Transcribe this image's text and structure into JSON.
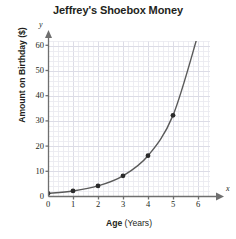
{
  "chart_data": {
    "type": "line",
    "title": "Jeffrey's Shoebox Money",
    "xlabel": "Age (Years)",
    "xlabel_bold_part": "Age",
    "xlabel_unit_part": " (Years)",
    "ylabel": "Amount on Birthday ($)",
    "x": [
      0,
      1,
      2,
      3,
      4,
      5,
      6
    ],
    "values": [
      1,
      2,
      4,
      8,
      16,
      32,
      64
    ],
    "xlim": [
      0,
      6.5
    ],
    "ylim": [
      0,
      66
    ],
    "xticks": [
      "0",
      "1",
      "2",
      "3",
      "4",
      "5",
      "6"
    ],
    "yticks": [
      "0",
      "10",
      "20",
      "30",
      "40",
      "50",
      "60"
    ],
    "xtick_values": [
      0,
      1,
      2,
      3,
      4,
      5,
      6
    ],
    "ytick_values": [
      0,
      10,
      20,
      30,
      40,
      50,
      60
    ],
    "grid": true,
    "legend": null,
    "markers": "filled-circle",
    "series_color": "#5a5a5a",
    "marker_color": "#2b2b2b",
    "grid_color": "#e8e8ef",
    "major_grid_color": "#dcdce6",
    "axis_color": "#6f6f6f",
    "axis_letters": {
      "x": "x",
      "y": "y"
    }
  }
}
